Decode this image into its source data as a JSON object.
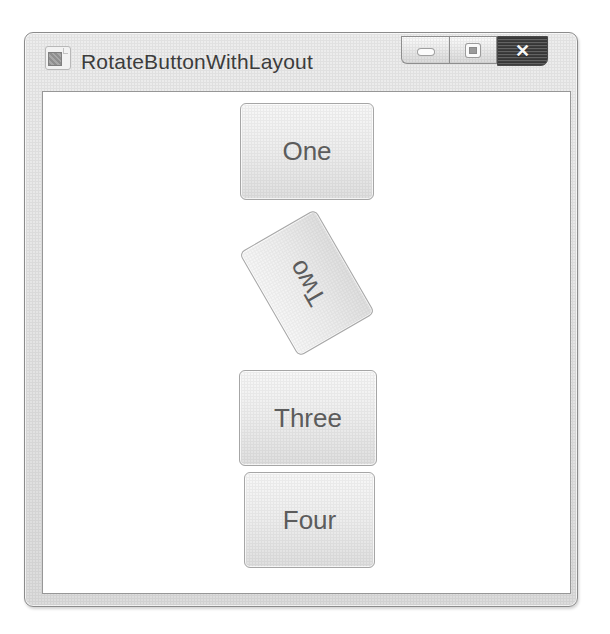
{
  "window": {
    "title": "RotateButtonWithLayout",
    "caption_buttons": {
      "minimize_name": "minimize",
      "maximize_name": "maximize",
      "close_name": "close",
      "close_glyph": "✕"
    }
  },
  "buttons": [
    {
      "label": "One",
      "rotation_deg": 0
    },
    {
      "label": "Two",
      "rotation_deg": -120
    },
    {
      "label": "Three",
      "rotation_deg": 0
    },
    {
      "label": "Four",
      "rotation_deg": 0
    }
  ],
  "colors": {
    "frame": "#e3e3e3",
    "frame_border": "#8b8b8b",
    "client_background": "#ffffff",
    "button_face": "#ededed",
    "button_border": "#a6a6a6",
    "button_text": "#5c5c5c",
    "close_button": "#303030",
    "close_glyph_color": "#f5f5f5",
    "title_text": "#3c3c3c"
  }
}
